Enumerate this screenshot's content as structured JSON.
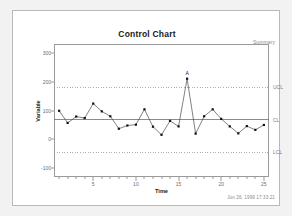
{
  "window": {
    "summary_label": "Summary",
    "timestamp": "Jun 26, 1999 17:33:21"
  },
  "chart_data": {
    "type": "line",
    "title": "Control Chart",
    "xlabel": "Time",
    "ylabel": "Variable",
    "x": [
      1,
      2,
      3,
      4,
      5,
      6,
      7,
      8,
      9,
      10,
      11,
      12,
      13,
      14,
      15,
      16,
      17,
      18,
      19,
      20,
      21,
      22,
      23,
      24,
      25
    ],
    "values": [
      99,
      57,
      79,
      74,
      124,
      97,
      80,
      37,
      48,
      51,
      104,
      44,
      16,
      64,
      45,
      210,
      20,
      80,
      104,
      71,
      45,
      21,
      46,
      33,
      50
    ],
    "xlim": [
      0.4,
      25.6
    ],
    "ylim": [
      -130,
      330
    ],
    "xticks": [
      5,
      10,
      15,
      20,
      25
    ],
    "yticks": [
      -100,
      0,
      100,
      200,
      300
    ],
    "ytick_labels": [
      "-100",
      "0",
      "100",
      "200",
      "300"
    ],
    "xtick_labels": [
      "5",
      "10",
      "15",
      "20",
      "25"
    ],
    "grid": false,
    "legend": "none",
    "series_name": "Variable",
    "marker": "filled-square",
    "line_color": "#4a4a4a",
    "marker_color": "#111111",
    "control_limits": [
      {
        "name": "UCL",
        "label": "UCL",
        "value": 180,
        "style": "dotted",
        "color": "#9a9a9a"
      },
      {
        "name": "CL",
        "label": "CL",
        "value": 68,
        "style": "solid",
        "color": "#6e6e6e"
      },
      {
        "name": "LCL",
        "label": "LCL",
        "value": -45,
        "style": "dotted",
        "color": "#9a9a9a"
      }
    ],
    "annotations": [
      {
        "label": "A",
        "x": 16,
        "y": 210,
        "note": "out-of-control point"
      }
    ]
  }
}
